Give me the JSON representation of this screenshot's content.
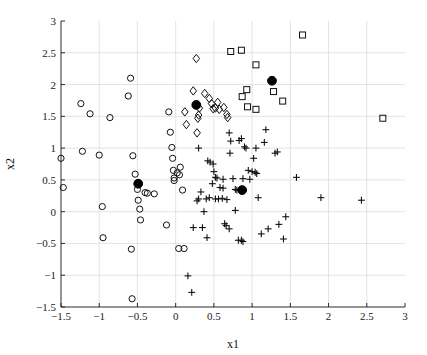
{
  "chart_data": {
    "type": "scatter",
    "title": "",
    "xlabel": "x1",
    "ylabel": "x2",
    "xlim": [
      -1.5,
      3
    ],
    "ylim": [
      -1.5,
      3
    ],
    "xticks": [
      -1.5,
      -1,
      -0.5,
      0,
      0.5,
      1,
      1.5,
      2,
      2.5,
      3
    ],
    "xticklabels": [
      "-1.5",
      "-1",
      "-0.5",
      "0",
      "0.5",
      "1",
      "1.5",
      "2",
      "2.5",
      "3"
    ],
    "yticks": [
      -1.5,
      -1,
      -0.5,
      0,
      0.5,
      1,
      1.5,
      2,
      2.5,
      3
    ],
    "yticklabels": [
      "-1.5",
      "-1",
      "-0.5",
      "0",
      "0.5",
      "1",
      "1.5",
      "2",
      "2.5",
      "3"
    ],
    "grid": true,
    "legend": "none",
    "series": [
      {
        "name": "cluster-1",
        "marker": "circle",
        "color": "#111111",
        "points": [
          [
            -1.5,
            0.84
          ],
          [
            -1.47,
            0.38
          ],
          [
            -1.24,
            1.7
          ],
          [
            -1.22,
            0.95
          ],
          [
            -1.12,
            1.54
          ],
          [
            -1.0,
            0.89
          ],
          [
            -0.96,
            0.08
          ],
          [
            -0.95,
            -0.41
          ],
          [
            -0.86,
            1.48
          ],
          [
            -0.59,
            2.1
          ],
          [
            -0.58,
            -0.59
          ],
          [
            -0.57,
            -1.37
          ],
          [
            -0.62,
            1.82
          ],
          [
            -0.56,
            0.88
          ],
          [
            -0.53,
            0.59
          ],
          [
            -0.5,
            0.35
          ],
          [
            -0.49,
            0.18
          ],
          [
            -0.47,
            0.04
          ],
          [
            -0.46,
            -0.13
          ],
          [
            -0.4,
            0.3
          ],
          [
            -0.37,
            0.29
          ],
          [
            -0.28,
            0.28
          ],
          [
            -0.12,
            -0.21
          ],
          [
            -0.09,
            1.57
          ],
          [
            -0.07,
            1.25
          ],
          [
            -0.05,
            1.01
          ],
          [
            -0.04,
            0.84
          ],
          [
            -0.03,
            0.65
          ],
          [
            -0.02,
            0.53
          ],
          [
            -0.02,
            0.49
          ],
          [
            0.02,
            0.61
          ],
          [
            0.06,
            0.7
          ],
          [
            0.04,
            -0.58
          ],
          [
            0.11,
            -0.58
          ],
          [
            0.09,
            0.34
          ],
          [
            0.05,
            0.58
          ]
        ]
      },
      {
        "name": "cluster-2",
        "marker": "diamond",
        "color": "#111111",
        "points": [
          [
            0.27,
            2.41
          ],
          [
            0.23,
            1.9
          ],
          [
            0.12,
            1.57
          ],
          [
            0.14,
            1.37
          ],
          [
            0.29,
            1.47
          ],
          [
            0.3,
            1.52
          ],
          [
            0.31,
            1.63
          ],
          [
            0.28,
            1.24
          ],
          [
            0.38,
            1.86
          ],
          [
            0.44,
            1.78
          ],
          [
            0.47,
            1.7
          ],
          [
            0.49,
            1.62
          ],
          [
            0.52,
            1.63
          ],
          [
            0.57,
            1.61
          ],
          [
            0.63,
            1.64
          ],
          [
            0.67,
            1.53
          ],
          [
            0.68,
            1.48
          ],
          [
            0.55,
            1.72
          ]
        ]
      },
      {
        "name": "cluster-3",
        "marker": "plus",
        "color": "#111111",
        "points": [
          [
            0.16,
            -1.01
          ],
          [
            0.21,
            -1.27
          ],
          [
            0.3,
            1.0
          ],
          [
            0.33,
            0.31
          ],
          [
            0.28,
            0.17
          ],
          [
            0.3,
            0.2
          ],
          [
            0.23,
            -0.25
          ],
          [
            0.35,
            -0.25
          ],
          [
            0.4,
            0.2
          ],
          [
            0.42,
            0.8
          ],
          [
            0.45,
            0.78
          ],
          [
            0.44,
            0.22
          ],
          [
            0.41,
            -0.41
          ],
          [
            0.49,
            0.75
          ],
          [
            0.5,
            0.63
          ],
          [
            0.52,
            0.54
          ],
          [
            0.54,
            0.53
          ],
          [
            0.48,
            0.44
          ],
          [
            0.52,
            0.2
          ],
          [
            0.56,
            0.2
          ],
          [
            0.61,
            0.21
          ],
          [
            0.58,
            0.38
          ],
          [
            0.62,
            0.37
          ],
          [
            0.67,
            0.19
          ],
          [
            0.64,
            -0.19
          ],
          [
            0.66,
            -0.22
          ],
          [
            0.7,
            -0.27
          ],
          [
            0.7,
            1.24
          ],
          [
            0.72,
            1.11
          ],
          [
            0.71,
            0.92
          ],
          [
            0.75,
            0.52
          ],
          [
            0.78,
            0.35
          ],
          [
            0.8,
            0.34
          ],
          [
            0.78,
            0.02
          ],
          [
            0.82,
            -0.45
          ],
          [
            0.86,
            -0.45
          ],
          [
            0.88,
            -0.47
          ],
          [
            0.83,
            1.12
          ],
          [
            0.86,
            1.15
          ],
          [
            0.9,
            1.02
          ],
          [
            0.92,
            1.0
          ],
          [
            0.88,
            0.52
          ],
          [
            0.95,
            0.65
          ],
          [
            0.97,
            0.51
          ],
          [
            1.0,
            0.63
          ],
          [
            1.04,
            0.62
          ],
          [
            1.06,
            0.6
          ],
          [
            1.02,
            0.84
          ],
          [
            1.05,
            1.0
          ],
          [
            1.08,
            0.22
          ],
          [
            1.12,
            -0.35
          ],
          [
            1.18,
            1.29
          ],
          [
            1.16,
            1.09
          ],
          [
            1.21,
            -0.27
          ],
          [
            1.3,
            0.92
          ],
          [
            1.33,
            0.94
          ],
          [
            1.35,
            -0.2
          ],
          [
            1.41,
            -0.43
          ],
          [
            1.44,
            -0.08
          ],
          [
            1.58,
            0.54
          ],
          [
            1.9,
            0.22
          ],
          [
            2.43,
            0.18
          ],
          [
            0.37,
            0.0
          ],
          [
            0.62,
            0.51
          ]
        ]
      },
      {
        "name": "cluster-4",
        "marker": "square",
        "color": "#111111",
        "points": [
          [
            0.72,
            2.52
          ],
          [
            0.86,
            2.54
          ],
          [
            1.05,
            2.31
          ],
          [
            1.66,
            2.78
          ],
          [
            0.93,
            1.92
          ],
          [
            0.87,
            1.81
          ],
          [
            0.94,
            1.65
          ],
          [
            1.05,
            1.61
          ],
          [
            1.28,
            1.89
          ],
          [
            1.4,
            1.74
          ],
          [
            2.71,
            1.47
          ]
        ]
      },
      {
        "name": "centroids",
        "marker": "filled-circle",
        "color": "#000000",
        "points": [
          [
            -0.49,
            0.44
          ],
          [
            0.27,
            1.68
          ],
          [
            0.87,
            0.34
          ],
          [
            1.26,
            2.06
          ]
        ]
      }
    ]
  }
}
